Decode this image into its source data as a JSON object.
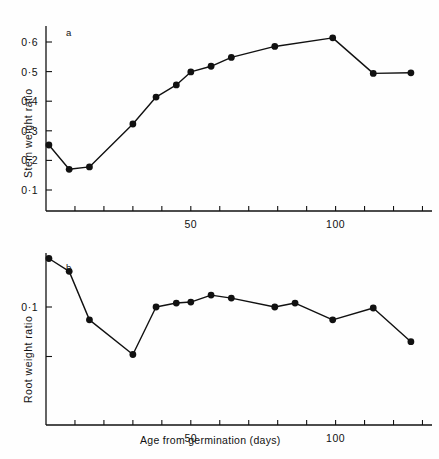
{
  "figure": {
    "background": "#fefefe",
    "ink_color": "#111111",
    "x_axis_label": "Age from germination (days)"
  },
  "chart_data": [
    {
      "type": "line",
      "panel": "a",
      "panel_label": "a",
      "title": "",
      "xlabel": "Age from germination (days)",
      "ylabel": "Stem weight ratio",
      "xlim": [
        0,
        133
      ],
      "ylim": [
        0,
        0.65
      ],
      "grid": false,
      "legend": null,
      "marker": "filled-circle",
      "x_tick_labels": [
        "50",
        "100"
      ],
      "x_tick_values": [
        50,
        100
      ],
      "x_minor_tick_values": [
        10,
        20,
        30,
        40,
        50,
        60,
        70,
        80,
        90,
        100,
        110,
        120,
        130
      ],
      "y_tick_labels": [
        "0·1",
        "0·2",
        "0·3",
        "0·4",
        "0·5",
        "0·6"
      ],
      "y_tick_values": [
        0.1,
        0.2,
        0.3,
        0.4,
        0.5,
        0.6
      ],
      "x": [
        1,
        8,
        15,
        30,
        38,
        45,
        50,
        57,
        64,
        79,
        99,
        113,
        126
      ],
      "values": [
        0.252,
        0.17,
        0.178,
        0.323,
        0.414,
        0.455,
        0.499,
        0.518,
        0.548,
        0.585,
        0.614,
        0.494,
        0.496
      ]
    },
    {
      "type": "line",
      "panel": "b",
      "panel_label": "b",
      "title": "",
      "xlabel": "Age from germination (days)",
      "ylabel": "Root weight ratio",
      "xlim": [
        0,
        133
      ],
      "ylim": [
        0,
        0.165
      ],
      "grid": false,
      "legend": null,
      "marker": "filled-circle",
      "x_tick_labels": [
        "50",
        "100"
      ],
      "x_tick_values": [
        50,
        100
      ],
      "x_minor_tick_values": [
        10,
        20,
        30,
        40,
        50,
        60,
        70,
        80,
        90,
        100,
        110,
        120,
        130
      ],
      "y_tick_labels": [
        "0·1"
      ],
      "y_tick_values": [
        0.1
      ],
      "y_minor_tick_values": [
        0.05,
        0.15
      ],
      "x": [
        1,
        8,
        15,
        30,
        38,
        45,
        50,
        57,
        64,
        79,
        86,
        99,
        113,
        126
      ],
      "values": [
        0.149,
        0.136,
        0.087,
        0.052,
        0.1,
        0.104,
        0.105,
        0.112,
        0.109,
        0.1,
        0.104,
        0.087,
        0.099,
        0.065
      ]
    }
  ]
}
